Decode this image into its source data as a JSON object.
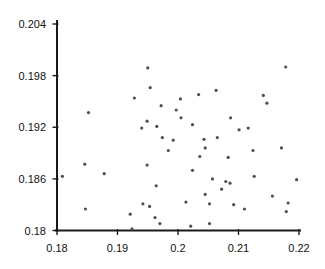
{
  "chart_data": {
    "type": "scatter",
    "title": "",
    "xlabel": "",
    "ylabel": "",
    "xlim": [
      0.18,
      0.22
    ],
    "ylim": [
      0.18,
      0.204
    ],
    "grid": false,
    "legend": null,
    "axis_color": "#1a1a1a",
    "tick_label_color": "#111111",
    "marker": {
      "shape": "dot",
      "color": "#4f4f4f",
      "radius": 1.6
    },
    "xticks": {
      "values": [
        0.18,
        0.19,
        0.2,
        0.21,
        0.22
      ],
      "labels": [
        "0.18",
        "0.19",
        "0.2",
        "0.21",
        "0.22"
      ]
    },
    "yticks": {
      "values": [
        0.18,
        0.186,
        0.192,
        0.198,
        0.204
      ],
      "labels": [
        "0.18",
        "0.186",
        "0.192",
        "0.198",
        "0.204"
      ]
    },
    "points": [
      [
        0.1928,
        0.1954
      ],
      [
        0.1852,
        0.1937
      ],
      [
        0.195,
        0.1989
      ],
      [
        0.1954,
        0.1966
      ],
      [
        0.2004,
        0.1953
      ],
      [
        0.2034,
        0.1958
      ],
      [
        0.2063,
        0.1963
      ],
      [
        0.1972,
        0.1945
      ],
      [
        0.1997,
        0.194
      ],
      [
        0.2005,
        0.1931
      ],
      [
        0.2024,
        0.1923
      ],
      [
        0.2087,
        0.1931
      ],
      [
        0.2178,
        0.199
      ],
      [
        0.2141,
        0.1957
      ],
      [
        0.2147,
        0.1948
      ],
      [
        0.1949,
        0.1927
      ],
      [
        0.194,
        0.1919
      ],
      [
        0.1965,
        0.1921
      ],
      [
        0.1846,
        0.1877
      ],
      [
        0.1878,
        0.1866
      ],
      [
        0.1809,
        0.1863
      ],
      [
        0.1847,
        0.1825
      ],
      [
        0.1921,
        0.1819
      ],
      [
        0.1924,
        0.1802
      ],
      [
        0.1974,
        0.1908
      ],
      [
        0.1992,
        0.1905
      ],
      [
        0.2043,
        0.1906
      ],
      [
        0.2065,
        0.1908
      ],
      [
        0.1984,
        0.1893
      ],
      [
        0.2045,
        0.1896
      ],
      [
        0.2036,
        0.1886
      ],
      [
        0.2083,
        0.1885
      ],
      [
        0.1949,
        0.1876
      ],
      [
        0.2024,
        0.187
      ],
      [
        0.2057,
        0.186
      ],
      [
        0.2079,
        0.1857
      ],
      [
        0.2086,
        0.1855
      ],
      [
        0.1964,
        0.1852
      ],
      [
        0.2072,
        0.1848
      ],
      [
        0.2045,
        0.1842
      ],
      [
        0.2013,
        0.1833
      ],
      [
        0.2052,
        0.1831
      ],
      [
        0.1942,
        0.1831
      ],
      [
        0.1953,
        0.1828
      ],
      [
        0.1962,
        0.1815
      ],
      [
        0.197,
        0.1808
      ],
      [
        0.2021,
        0.1805
      ],
      [
        0.2052,
        0.1808
      ],
      [
        0.2092,
        0.183
      ],
      [
        0.2101,
        0.1917
      ],
      [
        0.2116,
        0.1919
      ],
      [
        0.2124,
        0.1893
      ],
      [
        0.2171,
        0.1896
      ],
      [
        0.2126,
        0.1863
      ],
      [
        0.2196,
        0.1859
      ],
      [
        0.2156,
        0.184
      ],
      [
        0.2182,
        0.1832
      ],
      [
        0.211,
        0.1825
      ],
      [
        0.2179,
        0.1822
      ]
    ],
    "layout": {
      "width": 325,
      "height": 269,
      "plot_left": 57,
      "plot_right": 299,
      "plot_top": 24,
      "plot_bottom": 230.5,
      "x_axis_overhang_left": 2,
      "x_axis_overhang_right": 2,
      "y_axis_top": 20,
      "tick_out": 4.5,
      "tick_in": 1.5,
      "x_label_baseline_offset": 21.5,
      "y_label_right_edge": 46
    }
  }
}
